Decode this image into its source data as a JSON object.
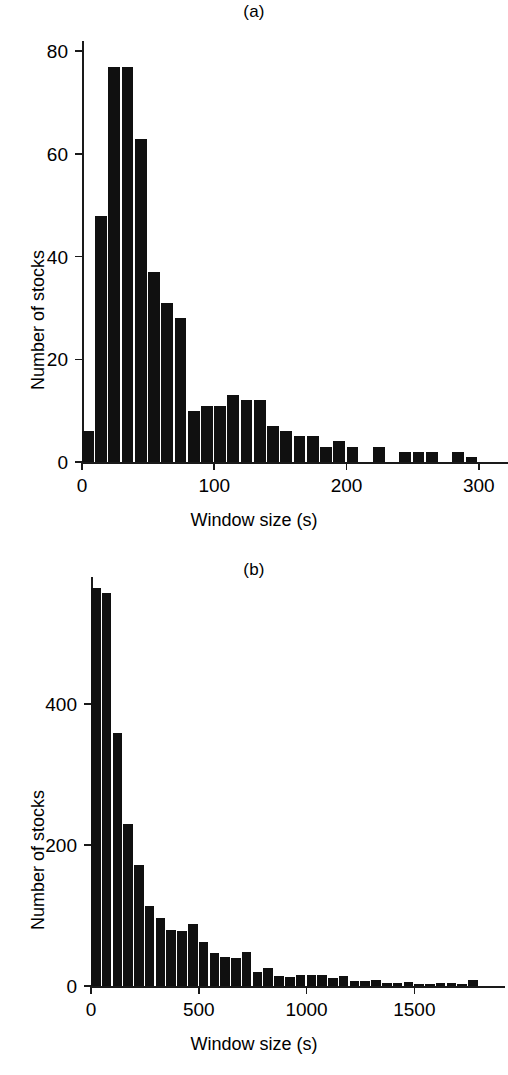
{
  "figure": {
    "background": "#ffffff",
    "bar_color": "#101010",
    "axis_color": "#1a1a1a"
  },
  "panels": {
    "a": {
      "label": "(a)",
      "xlabel": "Window size (s)",
      "ylabel": "Number of stocks",
      "y_ticks": [
        "0",
        "20",
        "40",
        "60",
        "80"
      ],
      "x_ticks": [
        "0",
        "100",
        "200",
        "300"
      ]
    },
    "b": {
      "label": "(b)",
      "xlabel": "Window size (s)",
      "ylabel": "Number of stocks",
      "y_ticks": [
        "0",
        "200",
        "400"
      ],
      "x_ticks": [
        "0",
        "500",
        "1000",
        "1500"
      ]
    }
  },
  "chart_data": [
    {
      "type": "bar",
      "panel": "a",
      "title": "(a)",
      "xlabel": "Window size (s)",
      "ylabel": "Number of stocks",
      "xlim": [
        0,
        310
      ],
      "ylim": [
        0,
        82
      ],
      "grid": false,
      "legend": null,
      "bin_width": 10,
      "bin_starts": [
        0,
        10,
        20,
        30,
        40,
        50,
        60,
        70,
        80,
        90,
        100,
        110,
        120,
        130,
        140,
        150,
        160,
        170,
        180,
        190,
        200,
        210,
        220,
        230,
        240,
        250,
        260,
        270,
        280,
        290
      ],
      "categories": [
        "0-10",
        "10-20",
        "20-30",
        "30-40",
        "40-50",
        "50-60",
        "60-70",
        "70-80",
        "80-90",
        "90-100",
        "100-110",
        "110-120",
        "120-130",
        "130-140",
        "140-150",
        "150-160",
        "160-170",
        "170-180",
        "180-190",
        "190-200",
        "200-210",
        "210-220",
        "220-230",
        "230-240",
        "240-250",
        "250-260",
        "260-270",
        "270-280",
        "280-290",
        "290-300"
      ],
      "values": [
        6,
        48,
        77,
        77,
        63,
        37,
        31,
        28,
        10,
        11,
        11,
        13,
        12,
        12,
        7,
        6,
        5,
        5,
        3,
        4,
        3,
        0,
        3,
        0,
        2,
        2,
        2,
        0,
        2,
        1
      ],
      "y_ticks": [
        0,
        20,
        40,
        60,
        80
      ],
      "x_ticks": [
        0,
        100,
        200,
        300
      ]
    },
    {
      "type": "bar",
      "panel": "b",
      "title": "(b)",
      "xlabel": "Window size (s)",
      "ylabel": "Number of stocks",
      "xlim": [
        0,
        1800
      ],
      "ylim": [
        0,
        580
      ],
      "grid": false,
      "legend": null,
      "bin_width": 50,
      "bin_starts": [
        0,
        50,
        100,
        150,
        200,
        250,
        300,
        350,
        400,
        450,
        500,
        550,
        600,
        650,
        700,
        750,
        800,
        850,
        900,
        950,
        1000,
        1050,
        1100,
        1150,
        1200,
        1250,
        1300,
        1350,
        1400,
        1450,
        1500,
        1550,
        1600,
        1650,
        1700,
        1750
      ],
      "categories": [
        "0-50",
        "50-100",
        "100-150",
        "150-200",
        "200-250",
        "250-300",
        "300-350",
        "350-400",
        "400-450",
        "450-500",
        "500-550",
        "550-600",
        "600-650",
        "650-700",
        "700-750",
        "750-800",
        "800-850",
        "850-900",
        "900-950",
        "950-1000",
        "1000-1050",
        "1050-1100",
        "1100-1150",
        "1150-1200",
        "1200-1250",
        "1250-1300",
        "1300-1350",
        "1350-1400",
        "1400-1450",
        "1450-1500",
        "1500-1550",
        "1550-1600",
        "1600-1650",
        "1650-1700",
        "1700-1750",
        "1750-1800"
      ],
      "values": [
        564,
        558,
        359,
        230,
        172,
        113,
        96,
        80,
        78,
        88,
        62,
        47,
        41,
        40,
        48,
        20,
        25,
        14,
        13,
        16,
        16,
        16,
        11,
        14,
        7,
        7,
        9,
        4,
        4,
        5,
        3,
        3,
        4,
        4,
        3,
        9
      ],
      "y_ticks": [
        0,
        200,
        400
      ],
      "x_ticks": [
        0,
        500,
        1000,
        1500
      ]
    }
  ]
}
